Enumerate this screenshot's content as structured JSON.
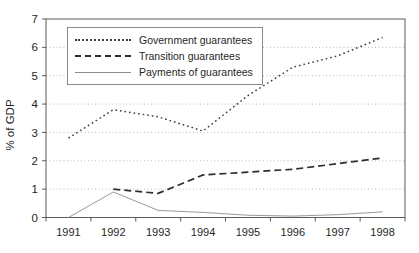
{
  "chart_data": {
    "type": "line",
    "title": "",
    "xlabel": "",
    "ylabel": "% of GDP",
    "categories": [
      "1991",
      "1992",
      "1993",
      "1994",
      "1995",
      "1996",
      "1997",
      "1998"
    ],
    "ylim": [
      0,
      7
    ],
    "y_ticks": [
      0,
      1,
      2,
      3,
      4,
      5,
      6,
      7
    ],
    "grid": "horizontal-dotted",
    "legend_position": "top-left-inside",
    "series": [
      {
        "name": "Government guarantees",
        "style": "dotted",
        "values": [
          2.8,
          3.8,
          3.55,
          3.05,
          4.3,
          5.3,
          5.7,
          6.35
        ]
      },
      {
        "name": "Transition guarantees",
        "style": "dashed",
        "values": [
          null,
          1.0,
          0.85,
          1.5,
          1.6,
          1.7,
          1.9,
          2.1
        ]
      },
      {
        "name": "Payments of guarantees",
        "style": "solid",
        "values": [
          0,
          0.9,
          0.25,
          0.18,
          0.08,
          0.05,
          0.1,
          0.2
        ]
      }
    ],
    "colors": {
      "dotted_line": "#3c3c3c",
      "dashed_line": "#2e2e2e",
      "solid_line": "#8c8c8c",
      "grid": "#b8b8b8",
      "axis": "#5a5a5a",
      "text": "#1f1f1f",
      "background": "#ffffff"
    }
  }
}
